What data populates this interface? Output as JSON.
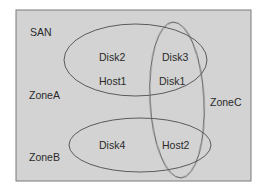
{
  "diagram": {
    "container_label": "SAN",
    "zones": [
      {
        "name": "ZoneA",
        "members": [
          "Disk2",
          "Host1",
          "Disk3",
          "Disk1"
        ]
      },
      {
        "name": "ZoneB",
        "members": [
          "Disk4",
          "Host2"
        ]
      },
      {
        "name": "ZoneC",
        "members": [
          "Disk3",
          "Disk1",
          "Host2"
        ]
      }
    ],
    "nodes": {
      "disk1": "Disk1",
      "disk2": "Disk2",
      "disk3": "Disk3",
      "disk4": "Disk4",
      "host1": "Host1",
      "host2": "Host2"
    },
    "labels": {
      "san": "SAN",
      "zone_a": "ZoneA",
      "zone_b": "ZoneB",
      "zone_c": "ZoneC"
    },
    "colors": {
      "background": "#d3d3d3",
      "stroke": "#5a5a5a",
      "text": "#2a2a2a"
    }
  }
}
